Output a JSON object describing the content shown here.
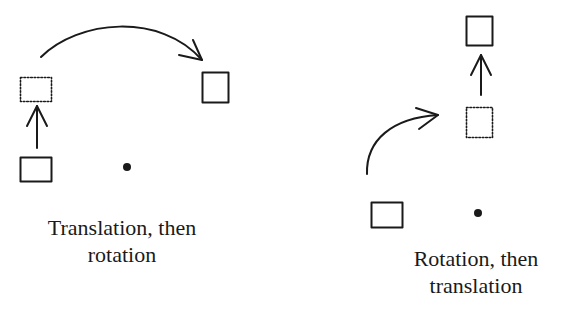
{
  "colors": {
    "ink": "#1a1a1a",
    "background": "#ffffff"
  },
  "panels": [
    {
      "id": "translation-then-rotation",
      "caption_lines": [
        "Translation, then",
        "rotation"
      ],
      "elements": {
        "original_box": {
          "x": 20,
          "y": 157,
          "w": 31,
          "h": 24,
          "style": "solid"
        },
        "intermediate_box": {
          "x": 20,
          "y": 77,
          "w": 31,
          "h": 24,
          "style": "dotted"
        },
        "final_box": {
          "x": 202,
          "y": 72,
          "w": 26,
          "h": 30,
          "style": "solid"
        },
        "pivot_point": {
          "cx": 127,
          "cy": 167,
          "r": 4
        },
        "translation_arrow": {
          "type": "straight",
          "from": [
            37,
            148
          ],
          "to": [
            37,
            106
          ]
        },
        "rotation_arrow": {
          "type": "curved",
          "from": [
            41,
            57
          ],
          "to": [
            202,
            60
          ]
        }
      }
    },
    {
      "id": "rotation-then-translation",
      "caption_lines": [
        "Rotation, then",
        "translation"
      ],
      "elements": {
        "original_box": {
          "x": 371,
          "y": 202,
          "w": 31,
          "h": 25,
          "style": "solid"
        },
        "intermediate_box": {
          "x": 466,
          "y": 107,
          "w": 26,
          "h": 30,
          "style": "dotted"
        },
        "final_box": {
          "x": 466,
          "y": 16,
          "w": 26,
          "h": 29,
          "style": "solid"
        },
        "pivot_point": {
          "cx": 478,
          "cy": 213,
          "r": 4
        },
        "rotation_arrow": {
          "type": "curved",
          "from": [
            367,
            174
          ],
          "to": [
            438,
            115
          ]
        },
        "translation_arrow": {
          "type": "straight",
          "from": [
            481,
            95
          ],
          "to": [
            481,
            55
          ]
        }
      }
    }
  ]
}
